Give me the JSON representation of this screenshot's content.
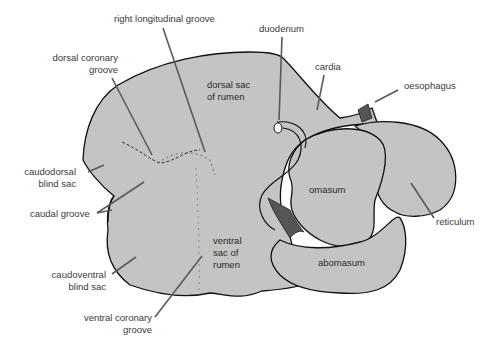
{
  "diagram": {
    "colors": {
      "organ_fill": "#c4c4c4",
      "outline": "#111111",
      "arrow": "#5a5a5a",
      "label_text": "#3a3a3a",
      "dark_fill": "#555555",
      "background": "#ffffff"
    },
    "outer_labels": {
      "right_longitudinal_groove": "right longitudinal groove",
      "dorsal_coronary_groove": "dorsal coronary\ngroove",
      "duodenum": "duodenum",
      "cardia": "cardia",
      "oesophagus": "oesophagus",
      "caudodorsal_blind_sac": "caudodorsal\nblind sac",
      "caudal_groove": "caudal groove",
      "caudoventral_blind_sac": "caudoventral\nblind sac",
      "ventral_coronary_groove": "ventral coronary\ngroove",
      "reticulum": "reticulum"
    },
    "inner_labels": {
      "dorsal_sac": "dorsal sac\nof rumen",
      "ventral_sac": "ventral\nsac of\nrumen",
      "omasum": "omasum",
      "abomasum": "abomasum"
    }
  }
}
